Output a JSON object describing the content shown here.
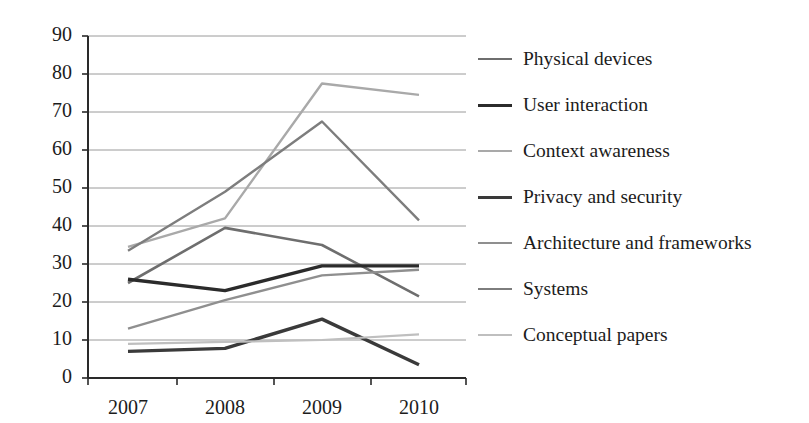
{
  "chart_data": {
    "type": "line",
    "title": "",
    "xlabel": "",
    "ylabel": "",
    "categories": [
      "2007",
      "2008",
      "2009",
      "2010"
    ],
    "x_tick_labels": [
      "2007",
      "2008",
      "2009",
      "2010"
    ],
    "y_tick_labels": [
      "0",
      "10",
      "20",
      "30",
      "40",
      "50",
      "60",
      "70",
      "80",
      "90"
    ],
    "y_ticks": [
      0,
      10,
      20,
      30,
      40,
      50,
      60,
      70,
      80,
      90
    ],
    "ylim": [
      0,
      90
    ],
    "grid": "horizontal",
    "legend_position": "right",
    "series": [
      {
        "name": "Physical devices",
        "color": "#6e6e6e",
        "width": 2.6,
        "values": [
          25,
          39.5,
          35,
          21.5
        ]
      },
      {
        "name": "User interaction",
        "color": "#2b2b2b",
        "width": 3.4,
        "values": [
          26,
          23,
          29.5,
          29.5
        ]
      },
      {
        "name": "Context awareness",
        "color": "#a9a9a9",
        "width": 2.4,
        "values": [
          34.5,
          42,
          77.5,
          74.5
        ]
      },
      {
        "name": "Privacy and security",
        "color": "#3a3a3a",
        "width": 3.4,
        "values": [
          7,
          7.8,
          15.5,
          3.5
        ]
      },
      {
        "name": "Architecture and frameworks",
        "color": "#8f8f8f",
        "width": 2.4,
        "values": [
          13,
          20.5,
          27,
          28.5
        ]
      },
      {
        "name": "Systems",
        "color": "#7d7d7d",
        "width": 2.4,
        "values": [
          33.5,
          49,
          67.5,
          41.5
        ]
      },
      {
        "name": "Conceptual papers",
        "color": "#bfbfbf",
        "width": 2.2,
        "values": [
          9,
          9.5,
          10,
          11.5
        ]
      }
    ],
    "axis_color": "#2a2a2a",
    "grid_color": "#9a9a9a"
  }
}
